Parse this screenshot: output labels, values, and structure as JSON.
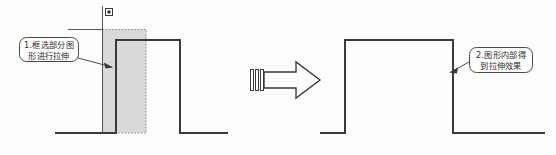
{
  "diagram": {
    "background_color": "#fdfdfc",
    "line_color": "#3a3a3a",
    "selection_fill_color": "#d9d9d9",
    "selection_border_color": "#8c8c8c",
    "callout_border_color": "#4a4a4a",
    "callout_fill_color": "#ffffff"
  },
  "callouts": [
    {
      "id": "callout-left",
      "line1": "1.框选部分图",
      "line2": "形进行拉伸",
      "full_text": "1.框选部分图形进行拉伸",
      "marker": "1."
    },
    {
      "id": "callout-right",
      "line1": "2.图形内部得",
      "line2": "到拉伸效果",
      "full_text": "2.图形内部得到拉伸效果",
      "marker": "2."
    }
  ],
  "shapes": {
    "before": {
      "name": "before-waveform",
      "baseline_y": 133,
      "pulse_top_y": 40,
      "pulse_left_x": 116,
      "pulse_right_x": 180,
      "path_start_x": 55,
      "path_end_x": 228
    },
    "after": {
      "name": "after-waveform",
      "baseline_y": 133,
      "pulse_top_y": 40,
      "pulse_left_x": 345,
      "pulse_right_x": 453,
      "path_start_x": 320,
      "path_end_x": 545
    },
    "selection_window": {
      "name": "crossing-selection-marquee",
      "x": 102,
      "y": 29,
      "width": 44,
      "height": 104,
      "style": "dotted"
    },
    "crosshair": {
      "name": "crosshair-cursor",
      "x": 102,
      "y": 29,
      "pickbox_x": 105,
      "pickbox_y": 8,
      "pickbox_size": 7
    },
    "arrow": {
      "name": "transition-block-arrow",
      "x": 250,
      "y": 62,
      "width": 70,
      "height": 36,
      "hatch_lines": 3
    }
  }
}
